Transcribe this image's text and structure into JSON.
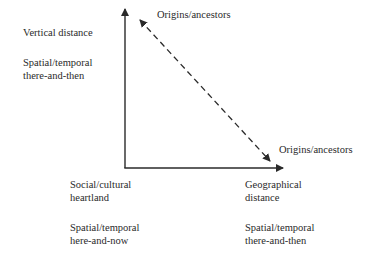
{
  "diagram": {
    "type": "axes-diagram",
    "top_label": "Origins/ancestors",
    "right_label": "Origins/ancestors",
    "y_axis": {
      "title": "Vertical distance",
      "end_label_line1": "Spatial/temporal",
      "end_label_line2": "there-and-then"
    },
    "origin": {
      "title_line1": "Social/cultural",
      "title_line2": "heartland",
      "label_line1": "Spatial/temporal",
      "label_line2": "here-and-now"
    },
    "x_axis": {
      "title_line1": "Geographical",
      "title_line2": "distance",
      "end_label_line1": "Spatial/temporal",
      "end_label_line2": "there-and-then"
    },
    "connector": {
      "style": "dashed",
      "arrowheads": "both",
      "from": "Origins/ancestors (vertical)",
      "to": "Origins/ancestors (geographical)"
    },
    "colors": {
      "ink": "#2a2a2a",
      "background": "#ffffff"
    }
  }
}
